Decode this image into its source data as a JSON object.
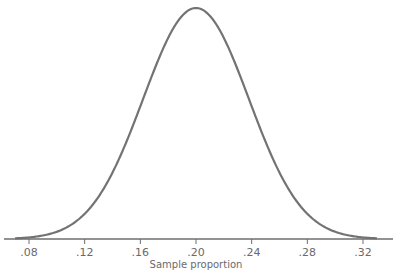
{
  "chart_data": {
    "type": "line",
    "title": "",
    "xlabel": "Sample proportion",
    "ylabel": "",
    "distribution": {
      "kind": "normal",
      "mean": 0.2,
      "sd": 0.038
    },
    "x_ticks": [
      0.08,
      0.12,
      0.16,
      0.2,
      0.24,
      0.28,
      0.32
    ],
    "x_tick_labels": [
      ".08",
      ".12",
      ".16",
      ".20",
      ".24",
      ".28",
      ".32"
    ],
    "xlim": [
      0.062,
      0.341
    ],
    "y_axis_shown": false,
    "grid": false,
    "legend": null,
    "curve_color": "#737373",
    "axis_color": "#6e6e6e"
  }
}
